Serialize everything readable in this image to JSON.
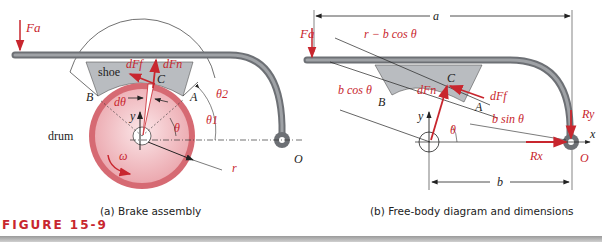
{
  "figure": {
    "label": "FIGURE 15-9",
    "accent_color": "#c8262e"
  },
  "panel_a": {
    "caption": "(a)  Brake assembly",
    "labels": {
      "applied_force": "Fa",
      "shoe": "shoe",
      "drum": "drum",
      "friction_force": "dFf",
      "normal_force": "dFn",
      "point_c": "C",
      "point_a": "A",
      "point_b": "B",
      "d_theta": "dθ",
      "y_axis": "y",
      "theta": "θ",
      "theta1": "θ1",
      "theta2": "θ2",
      "x_axis": "x",
      "pivot": "O",
      "omega": "ω",
      "radius": "r"
    }
  },
  "panel_b": {
    "caption": "(b)  Free-body diagram and dimensions",
    "labels": {
      "applied_force": "Fa",
      "dim_a": "a",
      "dim_b": "b",
      "r_minus_bcos": "r − b cos θ",
      "bcos": "b cos θ",
      "bsin": "b sin θ",
      "point_c": "C",
      "point_a": "A",
      "point_b": "B",
      "normal_force": "dFn",
      "friction_force": "dFf",
      "y_axis": "y",
      "x_axis": "x",
      "theta": "θ",
      "reaction_y": "Ry",
      "reaction_x": "Rx",
      "pivot": "O"
    }
  }
}
